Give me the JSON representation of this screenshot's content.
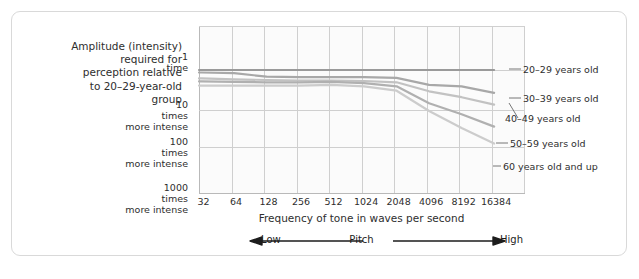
{
  "figure": {
    "axis_description": "Amplitude (intensity)\nrequired for\nperception relative\nto 20–29-year-old\ngroup"
  },
  "chart_data": {
    "type": "line",
    "title": "",
    "subtitle": "",
    "xlabel": "Frequency of tone in waves per second",
    "ylabel": "Amplitude (intensity) required for perception relative to 20–29-year-old group",
    "x_tick_labels": [
      "32",
      "64",
      "128",
      "256",
      "512",
      "1024",
      "2048",
      "4096",
      "8192",
      "16384"
    ],
    "x_values": [
      32,
      64,
      128,
      256,
      512,
      1024,
      2048,
      4096,
      8192,
      16384
    ],
    "x_scale": "log2",
    "y_tick_labels": [
      {
        "num": "1",
        "line2": "time",
        "line3": ""
      },
      {
        "num": "10",
        "line2": "times",
        "line3": "more intense"
      },
      {
        "num": "100",
        "line2": "times",
        "line3": "more intense"
      },
      {
        "num": "1000",
        "line2": "times",
        "line3": "more intense"
      }
    ],
    "y_values": [
      1,
      10,
      100,
      1000
    ],
    "y_scale": "log10-inverted",
    "ylim": [
      1,
      1000
    ],
    "grid": true,
    "legend_position": "right-inline",
    "pitch_axis": {
      "low": "Low",
      "center": "Pitch",
      "high": "High"
    },
    "series": [
      {
        "name": "20–29 years old",
        "color": "#9a9a9a",
        "values": [
          1.0,
          1.0,
          1.0,
          1.0,
          1.0,
          1.0,
          1.0,
          1.0,
          1.0,
          1.0
        ]
      },
      {
        "name": "30–39 years old",
        "color": "#a8a8a8",
        "values": [
          1.15,
          1.2,
          1.45,
          1.5,
          1.5,
          1.5,
          1.55,
          2.3,
          2.5,
          3.6
        ]
      },
      {
        "name": "40–49 years old",
        "color": "#c2c2c2",
        "values": [
          1.6,
          1.7,
          1.75,
          1.8,
          1.8,
          1.85,
          2.0,
          3.3,
          4.6,
          7.0
        ]
      },
      {
        "name": "50–59 years old",
        "color": "#b0b0b0",
        "values": [
          1.9,
          1.95,
          2.0,
          2.0,
          1.95,
          2.1,
          2.5,
          6.5,
          12.0,
          24.0
        ]
      },
      {
        "name": "60 years old and up",
        "color": "#cccccc",
        "values": [
          2.4,
          2.4,
          2.4,
          2.4,
          2.3,
          2.5,
          3.2,
          10.0,
          26.0,
          62.0
        ]
      }
    ]
  }
}
